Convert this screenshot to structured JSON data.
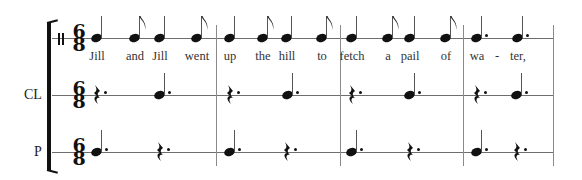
{
  "score": {
    "time_signature": {
      "top": "6",
      "bottom": "8"
    },
    "clef": "percussion-clef",
    "staves": [
      {
        "id": "voice",
        "label": "",
        "line_y": 38
      },
      {
        "id": "cl",
        "label": "CL",
        "line_y": 95
      },
      {
        "id": "p",
        "label": "P",
        "line_y": 152
      }
    ],
    "barlines_x": [
      216,
      340,
      463,
      553
    ],
    "voice_notes": [
      {
        "x": 97,
        "type": "quarter",
        "lyric": "Jill"
      },
      {
        "x": 135,
        "type": "eighth",
        "lyric": "and"
      },
      {
        "x": 160,
        "type": "quarter",
        "lyric": "Jill"
      },
      {
        "x": 197,
        "type": "eighth",
        "lyric": "went"
      },
      {
        "x": 230,
        "type": "quarter",
        "lyric": "up"
      },
      {
        "x": 263,
        "type": "eighth",
        "lyric": "the"
      },
      {
        "x": 287,
        "type": "quarter",
        "lyric": "hill"
      },
      {
        "x": 322,
        "type": "eighth",
        "lyric": "to"
      },
      {
        "x": 352,
        "type": "quarter",
        "lyric": "fetch"
      },
      {
        "x": 388,
        "type": "eighth",
        "lyric": "a"
      },
      {
        "x": 410,
        "type": "quarter",
        "lyric": "pail"
      },
      {
        "x": 446,
        "type": "eighth",
        "lyric": "of"
      },
      {
        "x": 477,
        "type": "dotted-quarter",
        "lyric": "wa"
      },
      {
        "x": 497,
        "type": "hyphen",
        "lyric": "-"
      },
      {
        "x": 518,
        "type": "dotted-quarter",
        "lyric": "ter,"
      }
    ],
    "cl_events": [
      {
        "x": 97,
        "type": "dotted-quarter-rest"
      },
      {
        "x": 160,
        "type": "dotted-quarter"
      },
      {
        "x": 230,
        "type": "dotted-quarter-rest"
      },
      {
        "x": 288,
        "type": "dotted-quarter"
      },
      {
        "x": 352,
        "type": "dotted-quarter-rest"
      },
      {
        "x": 410,
        "type": "dotted-quarter"
      },
      {
        "x": 477,
        "type": "dotted-quarter-rest"
      },
      {
        "x": 517,
        "type": "dotted-quarter"
      }
    ],
    "p_events": [
      {
        "x": 97,
        "type": "dotted-quarter"
      },
      {
        "x": 160,
        "type": "dotted-quarter-rest"
      },
      {
        "x": 230,
        "type": "dotted-quarter"
      },
      {
        "x": 287,
        "type": "dotted-quarter-rest"
      },
      {
        "x": 352,
        "type": "dotted-quarter"
      },
      {
        "x": 410,
        "type": "dotted-quarter-rest"
      },
      {
        "x": 477,
        "type": "dotted-quarter"
      },
      {
        "x": 517,
        "type": "dotted-quarter-rest"
      }
    ]
  }
}
